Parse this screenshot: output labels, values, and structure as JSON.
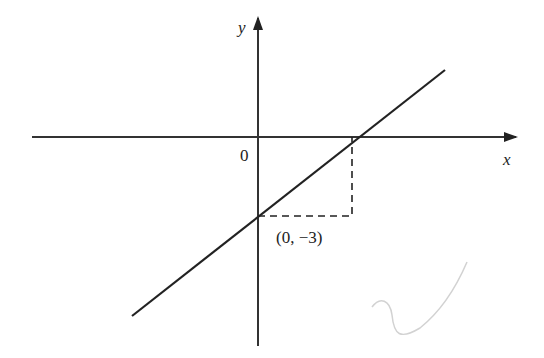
{
  "diagram": {
    "type": "coordinate-graph",
    "axes": {
      "x_label": "x",
      "y_label": "y",
      "origin_label": "0"
    },
    "line": {
      "description": "straight line with positive gradient crossing y-axis below origin",
      "y_intercept_label": "(0, −3)"
    },
    "colors": {
      "ink": "#222222",
      "background": "#ffffff",
      "pencil_mark": "#cfcfcf"
    }
  }
}
